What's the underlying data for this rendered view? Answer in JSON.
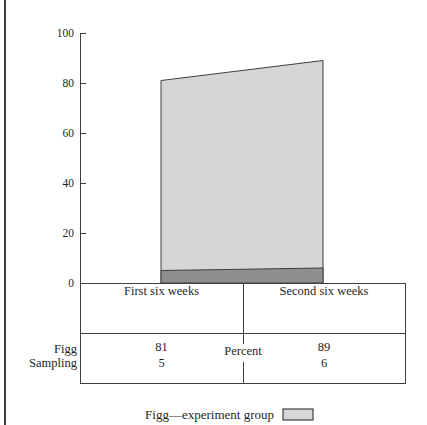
{
  "chart_data": {
    "type": "area",
    "categories": [
      "First six weeks",
      "Second six weeks"
    ],
    "series": [
      {
        "name": "Figg",
        "values": [
          81,
          89
        ]
      },
      {
        "name": "Sampling",
        "values": [
          5,
          6
        ]
      }
    ],
    "title": "",
    "xlabel": "",
    "ylabel": "",
    "unit_label": "Percent",
    "ylim": [
      0,
      100
    ],
    "yticks": [
      0,
      20,
      40,
      60,
      80,
      100
    ],
    "grid": false,
    "legend": [
      {
        "label": "Figg—experiment group"
      }
    ],
    "legend_position": "bottom-center"
  },
  "table": {
    "column_headers": [
      "First six weeks",
      "Second six weeks"
    ],
    "center_label": "Percent",
    "rows": [
      {
        "label": "Figg",
        "values": [
          "81",
          "89"
        ]
      },
      {
        "label": "Sampling",
        "values": [
          "5",
          "6"
        ]
      }
    ]
  },
  "colors": {
    "figg_fill": "#d6d6d6",
    "sampling_fill": "#8f8f8f",
    "line": "#3f3f3f",
    "text": "#1f1f1f",
    "background": "#ffffff"
  }
}
